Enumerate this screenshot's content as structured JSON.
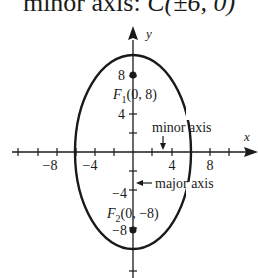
{
  "header": {
    "text": "minor axis: ",
    "math": "C(±6, 0)"
  },
  "diagram": {
    "axes": {
      "x_label": "x",
      "y_label": "y"
    },
    "x_ticks": [
      "−8",
      "−4",
      "4",
      "8"
    ],
    "y_ticks": [
      "8",
      "4",
      "−4",
      "−8"
    ],
    "foci": [
      {
        "name": "F1",
        "sub": "1",
        "coords": "(0, 8)"
      },
      {
        "name": "F2",
        "sub": "2",
        "coords": "(0, −8)"
      }
    ],
    "annotations": {
      "minor": "minor axis",
      "major": "major axis"
    },
    "ellipse": {
      "center": [
        0,
        0
      ],
      "a": 10,
      "b": 6
    }
  }
}
